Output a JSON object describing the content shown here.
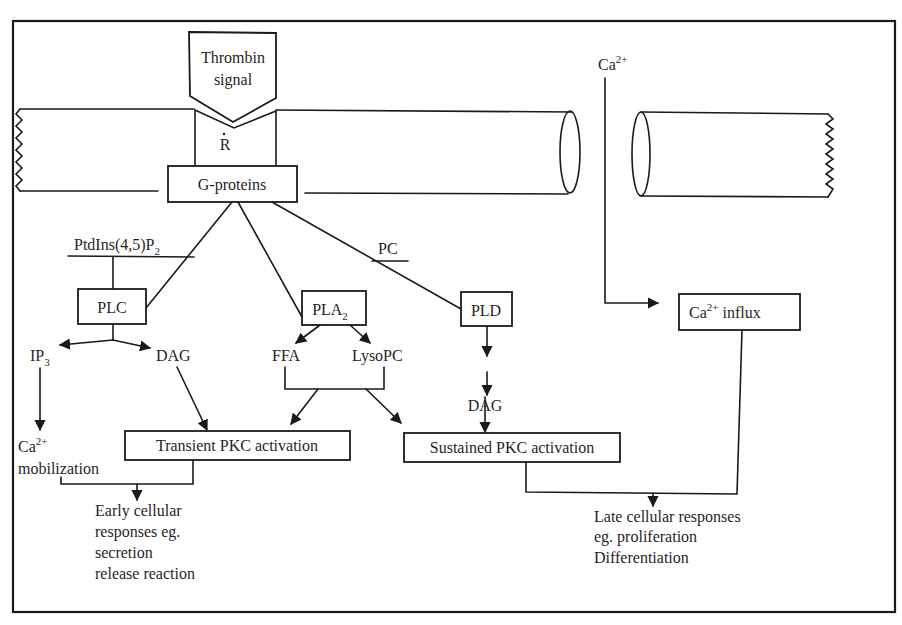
{
  "diagram": {
    "type": "signaling-pathway",
    "colors": {
      "ink": "#1a1a1a",
      "background": "#ffffff"
    },
    "signal": {
      "line1": "Thrombin",
      "line2": "signal"
    },
    "receptor": {
      "label": "R"
    },
    "g_proteins": {
      "label": "G-proteins"
    },
    "calcium_external": {
      "base": "Ca",
      "sup": "2+"
    },
    "substrates": {
      "ptdins": {
        "base": "PtdIns(4,5)P",
        "sub": "2"
      },
      "pc": {
        "label": "PC"
      }
    },
    "enzymes": {
      "plc": {
        "label": "PLC"
      },
      "pla2": {
        "base": "PLA",
        "sub": "2"
      },
      "pld": {
        "label": "PLD"
      }
    },
    "products": {
      "ip3": {
        "base": "IP",
        "sub": "3"
      },
      "dag_plc": {
        "label": "DAG"
      },
      "ffa": {
        "label": "FFA"
      },
      "lysopc": {
        "label": "LysoPC"
      },
      "dag_pld": {
        "label": "DAG"
      }
    },
    "calcium_mobilization": {
      "base": "Ca",
      "sup": "2+",
      "line2": "mobilization"
    },
    "calcium_influx": {
      "base": "Ca",
      "sup": "2+",
      "rest": " influx"
    },
    "transient_pkc": {
      "label": "Transient PKC activation"
    },
    "sustained_pkc": {
      "label": "Sustained PKC activation"
    },
    "early_responses": {
      "lines": [
        "Early cellular",
        "responses eg.",
        "secretion",
        "release reaction"
      ]
    },
    "late_responses": {
      "lines": [
        "Late cellular responses",
        "eg. proliferation",
        "Differentiation"
      ]
    }
  }
}
